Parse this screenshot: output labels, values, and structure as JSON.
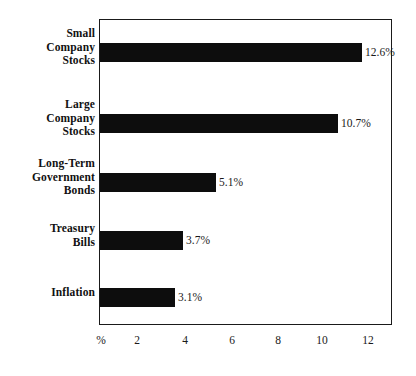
{
  "chart_data": {
    "type": "bar",
    "orientation": "horizontal",
    "title": "",
    "xlabel": "%",
    "ylabel": "",
    "categories": [
      "Small Company Stocks",
      "Large Company Stocks",
      "Long-Term Government Bonds",
      "Treasury Bills",
      "Inflation"
    ],
    "category_lines": [
      [
        "Small",
        "Company",
        "Stocks"
      ],
      [
        "Large",
        "Company",
        "Stocks"
      ],
      [
        "Long-Term",
        "Government",
        "Bonds"
      ],
      [
        "Treasury",
        "Bills"
      ],
      [
        "Inflation"
      ]
    ],
    "values": [
      12.6,
      10.7,
      5.1,
      3.7,
      3.1
    ],
    "value_labels": [
      "12.6%",
      "10.7%",
      "5.1%",
      "3.7%",
      "3.1%"
    ],
    "xlim": [
      0,
      12.5
    ],
    "xticks": [
      0,
      2,
      4,
      6,
      8,
      10,
      12
    ],
    "xtick_labels": [
      "%",
      "2",
      "4",
      "6",
      "8",
      "10",
      "12"
    ],
    "grid": false,
    "legend": null,
    "bar_color": "#0d0d0d",
    "frame_color": "#1a1a1a",
    "background": "#ffffff"
  },
  "series": {
    "bars": [
      {
        "label": "Small Company Stocks",
        "value_label": "12.6%",
        "left_px": 100,
        "top_px": 43,
        "width_px": 262,
        "value_left_px": 365
      },
      {
        "label": "Large Company Stocks",
        "value_label": "10.7%",
        "left_px": 100,
        "top_px": 114,
        "width_px": 238,
        "value_left_px": 341
      },
      {
        "label": "Long-Term Government Bonds",
        "value_label": "5.1%",
        "left_px": 100,
        "top_px": 173,
        "width_px": 116,
        "value_left_px": 219
      },
      {
        "label": "Treasury Bills",
        "value_label": "3.7%",
        "left_px": 100,
        "top_px": 231,
        "width_px": 83,
        "value_left_px": 186
      },
      {
        "label": "Inflation",
        "value_label": "3.1%",
        "left_px": 100,
        "top_px": 288,
        "width_px": 75,
        "value_left_px": 178
      }
    ]
  },
  "axis": {
    "ticks": [
      {
        "label": "%",
        "left_px": 101
      },
      {
        "label": "2",
        "left_px": 137
      },
      {
        "label": "4",
        "left_px": 185
      },
      {
        "label": "6",
        "left_px": 232
      },
      {
        "label": "8",
        "left_px": 278
      },
      {
        "label": "10",
        "left_px": 322
      },
      {
        "label": "12",
        "left_px": 368
      }
    ]
  },
  "labels": {
    "positions": [
      {
        "top_px": 27
      },
      {
        "top_px": 98
      },
      {
        "top_px": 157
      },
      {
        "top_px": 222
      },
      {
        "top_px": 286
      }
    ]
  }
}
